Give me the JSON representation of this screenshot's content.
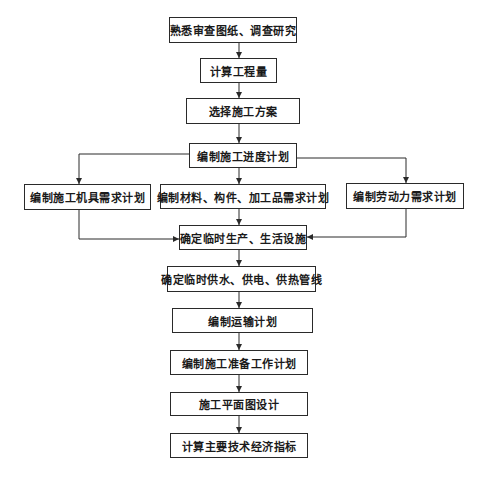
{
  "diagram": {
    "type": "flowchart",
    "nodes": [
      {
        "id": "n1",
        "label": "熟悉审查图纸、调查研究"
      },
      {
        "id": "n2",
        "label": "计算工程量"
      },
      {
        "id": "n3",
        "label": "选择施工方案"
      },
      {
        "id": "n4",
        "label": "编制施工进度计划"
      },
      {
        "id": "n5",
        "label": "编制施工机具需求计划"
      },
      {
        "id": "n6",
        "label": "编制材料、构件、加工品需求计划"
      },
      {
        "id": "n7",
        "label": "编制劳动力需求计划"
      },
      {
        "id": "n8",
        "label": "确定临时生产、生活设施"
      },
      {
        "id": "n9",
        "label": "确定临时供水、供电、供热管线"
      },
      {
        "id": "n10",
        "label": "编制运输计划"
      },
      {
        "id": "n11",
        "label": "编制施工准备工作计划"
      },
      {
        "id": "n12",
        "label": "施工平面图设计"
      },
      {
        "id": "n13",
        "label": "计算主要技术经济指标"
      }
    ],
    "edges": [
      {
        "from": "n1",
        "to": "n2"
      },
      {
        "from": "n2",
        "to": "n3"
      },
      {
        "from": "n3",
        "to": "n4"
      },
      {
        "from": "n4",
        "to": "n5"
      },
      {
        "from": "n4",
        "to": "n6"
      },
      {
        "from": "n4",
        "to": "n7"
      },
      {
        "from": "n5",
        "to": "n8"
      },
      {
        "from": "n6",
        "to": "n8"
      },
      {
        "from": "n7",
        "to": "n8"
      },
      {
        "from": "n8",
        "to": "n9"
      },
      {
        "from": "n9",
        "to": "n10"
      },
      {
        "from": "n10",
        "to": "n11"
      },
      {
        "from": "n11",
        "to": "n12"
      },
      {
        "from": "n12",
        "to": "n13"
      }
    ],
    "colors": {
      "line": "#2a2a2a",
      "box_border": "#2a2a2a",
      "text": "#1a1a1a",
      "background": "#ffffff"
    }
  }
}
